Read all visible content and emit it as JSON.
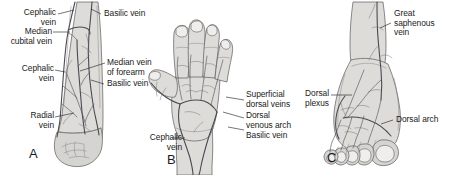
{
  "figure": {
    "background_color": "#ffffff",
    "ink_color": "#1a1a1a",
    "skin_color": "#dedcd9",
    "vein_color": "#4a4a52"
  },
  "panels": [
    {
      "letter": "A",
      "subject": "anterior-forearm",
      "labels": [
        {
          "text": "Cephalic\nvein",
          "side": "left"
        },
        {
          "text": "Median\ncubital vein",
          "side": "left"
        },
        {
          "text": "Cephalic\nvein",
          "side": "left"
        },
        {
          "text": "Radial\nvein",
          "side": "left"
        },
        {
          "text": "Basilic vein",
          "side": "right"
        },
        {
          "text": "Median vein\nof forearm",
          "side": "right"
        },
        {
          "text": "Basilic vein",
          "side": "right"
        }
      ]
    },
    {
      "letter": "B",
      "subject": "dorsum-of-hand",
      "labels": [
        {
          "text": "Superficial\ndorsal veins",
          "side": "right"
        },
        {
          "text": "Dorsal\nvenous arch",
          "side": "right"
        },
        {
          "text": "Basilic vein",
          "side": "right"
        },
        {
          "text": "Cephalic\nvein",
          "side": "left"
        }
      ]
    },
    {
      "letter": "C",
      "subject": "dorsum-of-foot",
      "labels": [
        {
          "text": "Great\nsaphenous\nvein",
          "side": "right"
        },
        {
          "text": "Dorsal\nplexus",
          "side": "left"
        },
        {
          "text": "Dorsal arch",
          "side": "right"
        }
      ]
    }
  ],
  "labels_flat": {
    "a_cephalic_upper": "Cephalic\nvein",
    "a_median_cubital": "Median\ncubital vein",
    "a_cephalic_lower": "Cephalic\nvein",
    "a_radial": "Radial\nvein",
    "a_basilic_upper": "Basilic vein",
    "a_median_forearm": "Median vein\nof forearm",
    "a_basilic_lower": "Basilic vein",
    "a_letter": "A",
    "b_superficial": "Superficial\ndorsal veins",
    "b_venous_arch": "Dorsal\nvenous arch",
    "b_basilic": "Basilic vein",
    "b_cephalic": "Cephalic\nvein",
    "b_letter": "B",
    "c_great_saphenous": "Great\nsaphenous\nvein",
    "c_dorsal_plexus": "Dorsal\nplexus",
    "c_dorsal_arch": "Dorsal arch",
    "c_letter": "C"
  }
}
